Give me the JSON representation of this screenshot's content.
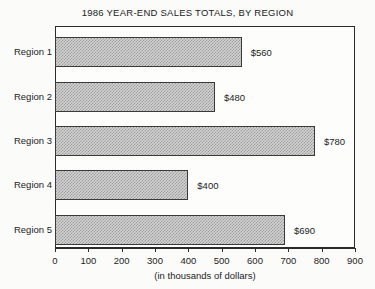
{
  "chart_data": {
    "type": "bar",
    "orientation": "horizontal",
    "title": "1986 YEAR-END SALES TOTALS, BY REGION",
    "xlabel": "(in thousands of dollars)",
    "ylabel": "",
    "categories": [
      "Region 1",
      "Region 2",
      "Region 3",
      "Region 4",
      "Region 5"
    ],
    "values": [
      560,
      480,
      780,
      400,
      690
    ],
    "data_labels": [
      "$560",
      "$480",
      "$780",
      "$400",
      "$690"
    ],
    "xlim": [
      0,
      900
    ],
    "xticks": [
      0,
      100,
      200,
      300,
      400,
      500,
      600,
      700,
      800,
      900
    ],
    "xtick_labels": [
      "0",
      "100",
      "200",
      "300",
      "400",
      "500",
      "600",
      "700",
      "800",
      "900"
    ],
    "grid": false,
    "legend": null,
    "bar_fill": "#d6d6d6",
    "bar_edge": "#3a3a3a",
    "frame_color": "#2b2b2b",
    "background": "#fbfbfa"
  }
}
